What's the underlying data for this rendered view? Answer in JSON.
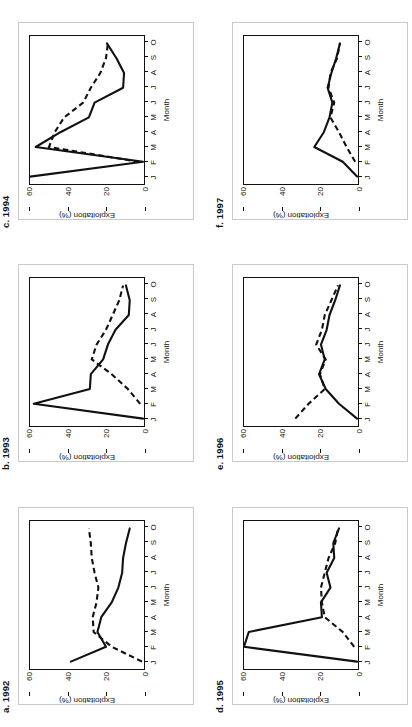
{
  "figure": {
    "months": [
      "J",
      "F",
      "M",
      "A",
      "M",
      "J",
      "J",
      "A",
      "S",
      "O"
    ],
    "y_label": "Exploitation (%)",
    "x_label": "Month",
    "y_ticks": [
      "0",
      "20",
      "40",
      "60"
    ],
    "y_tick_values": [
      0,
      20,
      40,
      60
    ],
    "ylim": [
      0,
      60
    ]
  },
  "panels": [
    {
      "id": "c-1994",
      "label": "c. 1994",
      "year": "1994",
      "grid": "row1-col1"
    },
    {
      "id": "f-1997",
      "label": "f. 1997",
      "year": "1997",
      "grid": "row1-col2"
    },
    {
      "id": "b-1993",
      "label": "b. 1993",
      "year": "1993",
      "grid": "row2-col1"
    },
    {
      "id": "e-1996",
      "label": "e. 1996",
      "year": "1996",
      "grid": "row2-col2"
    },
    {
      "id": "a-1992",
      "label": "a. 1992",
      "year": "1992",
      "grid": "row3-col1"
    },
    {
      "id": "d-1995",
      "label": "d. 1995",
      "year": "1995",
      "grid": "row3-col2"
    }
  ],
  "chart_data": [
    {
      "type": "line",
      "panel": "c. 1994",
      "title": "c. 1994",
      "xlabel": "Month",
      "ylabel": "Exploitation (%)",
      "categories": [
        "J",
        "F",
        "M",
        "A",
        "M",
        "J",
        "J",
        "A",
        "S",
        "O"
      ],
      "ylim": [
        0,
        60
      ],
      "grid": false,
      "legend": null,
      "series": [
        {
          "name": "solid",
          "style": "solid",
          "values": [
            60.0,
            0.5,
            57.0,
            44.0,
            29.0,
            26.0,
            11.0,
            10.5,
            14.5,
            19.5
          ]
        },
        {
          "name": "dashed",
          "style": "dashed",
          "values": [
            null,
            2.5,
            50.0,
            47.0,
            42.0,
            32.0,
            28.0,
            23.0,
            20.0,
            19.0
          ]
        }
      ]
    },
    {
      "type": "line",
      "panel": "f. 1997",
      "title": "f. 1997",
      "xlabel": "Month",
      "ylabel": "Exploitation (%)",
      "categories": [
        "J",
        "F",
        "M",
        "A",
        "M",
        "J",
        "J",
        "A",
        "S",
        "O"
      ],
      "ylim": [
        0,
        60
      ],
      "grid": false,
      "legend": null,
      "series": [
        {
          "name": "solid",
          "style": "solid",
          "values": [
            0.5,
            8.0,
            23.0,
            18.0,
            15.0,
            13.5,
            16.0,
            14.0,
            11.5,
            9.5
          ]
        },
        {
          "name": "dashed",
          "style": "dashed",
          "values": [
            null,
            1.5,
            6.0,
            10.0,
            14.5,
            12.5,
            15.5,
            14.5,
            11.0,
            9.5
          ]
        }
      ]
    },
    {
      "type": "line",
      "panel": "b. 1993",
      "title": "b. 1993",
      "xlabel": "Month",
      "ylabel": "Exploitation (%)",
      "categories": [
        "J",
        "F",
        "M",
        "A",
        "M",
        "J",
        "J",
        "A",
        "S",
        "O"
      ],
      "ylim": [
        0,
        60
      ],
      "grid": false,
      "legend": null,
      "series": [
        {
          "name": "solid",
          "style": "solid",
          "values": [
            0.5,
            58.0,
            28.5,
            28.0,
            21.5,
            19.0,
            15.0,
            8.0,
            7.5,
            9.5
          ]
        },
        {
          "name": "dashed",
          "style": "dashed",
          "values": [
            null,
            2.0,
            8.5,
            17.0,
            27.5,
            25.0,
            20.0,
            16.5,
            13.0,
            11.0
          ]
        }
      ]
    },
    {
      "type": "line",
      "panel": "e. 1996",
      "title": "e. 1996",
      "xlabel": "Month",
      "ylabel": "Exploitation (%)",
      "categories": [
        "J",
        "F",
        "M",
        "A",
        "M",
        "J",
        "J",
        "A",
        "S",
        "O"
      ],
      "ylim": [
        0,
        60
      ],
      "grid": false,
      "legend": null,
      "series": [
        {
          "name": "solid",
          "style": "solid",
          "values": [
            0.5,
            10.0,
            17.0,
            20.5,
            17.5,
            19.5,
            16.5,
            15.0,
            12.0,
            9.5
          ]
        },
        {
          "name": "dashed",
          "style": "dashed",
          "values": [
            33.0,
            26.0,
            17.5,
            20.0,
            17.0,
            22.0,
            19.0,
            17.5,
            14.0,
            10.5
          ]
        }
      ]
    },
    {
      "type": "line",
      "panel": "a. 1992",
      "title": "a. 1992",
      "xlabel": "Month",
      "ylabel": "Exploitation (%)",
      "categories": [
        "J",
        "F",
        "M",
        "A",
        "M",
        "J",
        "J",
        "A",
        "S",
        "O"
      ],
      "ylim": [
        0,
        60
      ],
      "grid": false,
      "legend": null,
      "series": [
        {
          "name": "solid",
          "style": "solid",
          "values": [
            38.5,
            20.0,
            24.5,
            22.5,
            17.0,
            13.5,
            11.5,
            11.0,
            9.5,
            7.5
          ]
        },
        {
          "name": "dashed",
          "style": "dashed",
          "values": [
            1.0,
            17.0,
            26.5,
            27.0,
            25.0,
            24.0,
            26.0,
            27.5,
            28.0,
            29.0
          ]
        }
      ]
    },
    {
      "type": "line",
      "panel": "d. 1995",
      "title": "d. 1995",
      "xlabel": "Month",
      "ylabel": "Exploitation (%)",
      "categories": [
        "J",
        "F",
        "M",
        "A",
        "M",
        "J",
        "J",
        "A",
        "S",
        "O"
      ],
      "ylim": [
        0,
        60
      ],
      "grid": false,
      "legend": null,
      "series": [
        {
          "name": "solid",
          "style": "solid",
          "values": [
            0.5,
            60.0,
            57.5,
            19.0,
            19.5,
            14.5,
            16.5,
            12.5,
            13.0,
            10.0
          ]
        },
        {
          "name": "dashed",
          "style": "dashed",
          "values": [
            null,
            2.0,
            8.0,
            17.5,
            19.0,
            19.5,
            17.5,
            15.5,
            12.0,
            10.5
          ]
        }
      ]
    }
  ]
}
